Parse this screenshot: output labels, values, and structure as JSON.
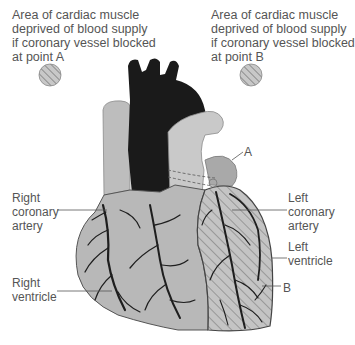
{
  "legend": {
    "a": {
      "lines": [
        "Area of cardiac muscle",
        "deprived of blood supply",
        "if coronary vessel blocked",
        "at point A"
      ],
      "swatch": "hatched-circle"
    },
    "b": {
      "lines": [
        "Area of cardiac muscle",
        "deprived of blood supply",
        "if coronary vessel blocked",
        "at point B"
      ],
      "swatch": "hatched-circle"
    }
  },
  "labels": {
    "right_coronary_artery": [
      "Right",
      "coronary",
      "artery"
    ],
    "right_ventricle": [
      "Right",
      "ventricle"
    ],
    "left_coronary_artery": [
      "Left",
      "coronary",
      "artery"
    ],
    "left_ventricle": [
      "Left",
      "ventricle"
    ],
    "point_a": "A",
    "point_b": "B"
  },
  "colors": {
    "muscle": "#b8b8b8",
    "muscle_light": "#cfcfcf",
    "aorta": "#1a1a1a",
    "vessel": "#1e1e1e",
    "hatch": "#7a7a7a",
    "leader": "#555555",
    "text": "#555555"
  }
}
